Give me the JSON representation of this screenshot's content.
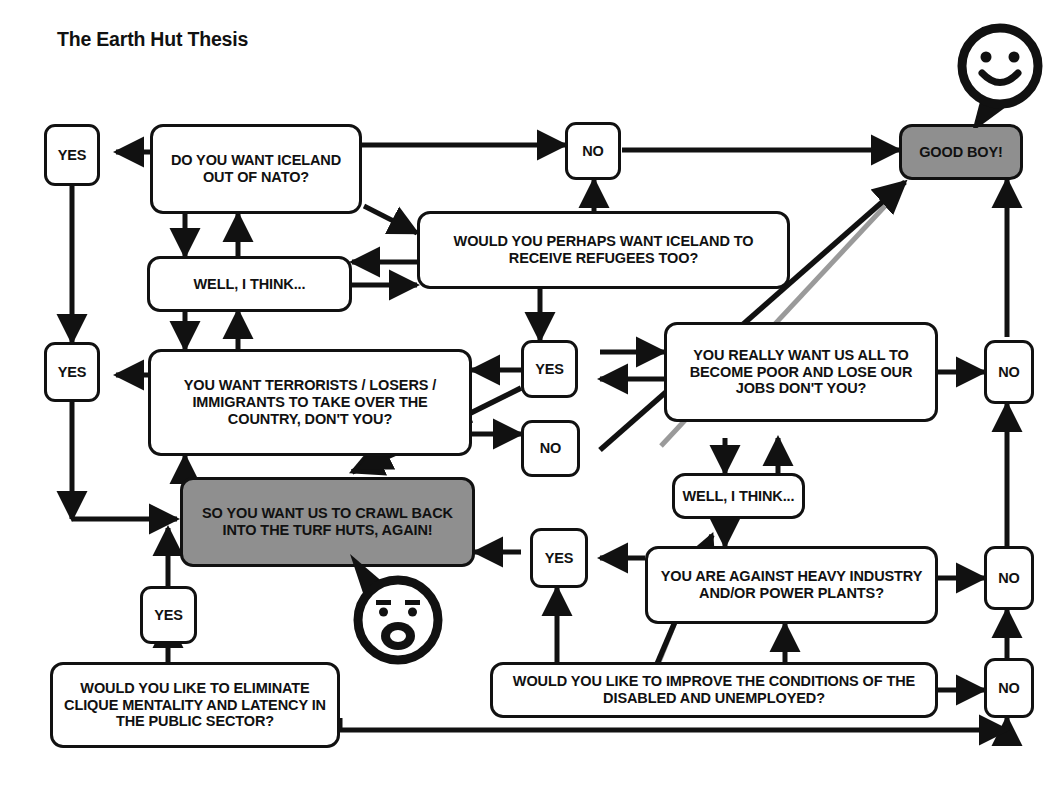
{
  "title": "The Earth Hut Thesis",
  "colors": {
    "ink": "#111111",
    "paper": "#ffffff",
    "shaded_fill": "#8f8f8f",
    "faint_diagonal": "#9a9a9a"
  },
  "diagram": {
    "type": "flowchart",
    "nodes": [
      {
        "id": "yes-top-left",
        "label": "YES",
        "kind": "answer",
        "shaded": false
      },
      {
        "id": "q-nato",
        "label": "DO YOU WANT ICELAND OUT OF NATO?",
        "kind": "question",
        "shaded": false
      },
      {
        "id": "no-top",
        "label": "NO",
        "kind": "answer",
        "shaded": false
      },
      {
        "id": "good-boy",
        "label": "GOOD BOY!",
        "kind": "verdict",
        "shaded": true
      },
      {
        "id": "think-top",
        "label": "WELL, I THINK...",
        "kind": "hedge",
        "shaded": false
      },
      {
        "id": "q-refugees",
        "label": "WOULD YOU PERHAPS WANT ICELAND TO RECEIVE REFUGEES TOO?",
        "kind": "question",
        "shaded": false
      },
      {
        "id": "yes-mid-left",
        "label": "YES",
        "kind": "answer",
        "shaded": false
      },
      {
        "id": "q-terrorists",
        "label": "YOU WANT TERRORISTS / LOSERS / IMMIGRANTS TO TAKE OVER THE COUNTRY, DON'T YOU?",
        "kind": "question",
        "shaded": false
      },
      {
        "id": "yes-center",
        "label": "YES",
        "kind": "answer",
        "shaded": false
      },
      {
        "id": "q-poor",
        "label": "YOU REALLY WANT US ALL TO BECOME POOR AND LOSE OUR JOBS DON'T YOU?",
        "kind": "question",
        "shaded": false
      },
      {
        "id": "no-right-upper",
        "label": "NO",
        "kind": "answer",
        "shaded": false
      },
      {
        "id": "no-center",
        "label": "NO",
        "kind": "answer",
        "shaded": false
      },
      {
        "id": "turf-huts",
        "label": "SO YOU WANT US TO CRAWL BACK INTO THE TURF HUTS, AGAIN!",
        "kind": "verdict",
        "shaded": true
      },
      {
        "id": "think-right",
        "label": "WELL, I THINK...",
        "kind": "hedge",
        "shaded": false
      },
      {
        "id": "yes-lower",
        "label": "YES",
        "kind": "answer",
        "shaded": false
      },
      {
        "id": "q-industry",
        "label": "YOU ARE AGAINST HEAVY INDUSTRY AND/OR POWER PLANTS?",
        "kind": "question",
        "shaded": false
      },
      {
        "id": "no-right-mid",
        "label": "NO",
        "kind": "answer",
        "shaded": false
      },
      {
        "id": "yes-bottom-left",
        "label": "YES",
        "kind": "answer",
        "shaded": false
      },
      {
        "id": "q-disabled",
        "label": "WOULD YOU LIKE TO IMPROVE THE CONDITIONS OF THE DISABLED AND UNEMPLOYED?",
        "kind": "question",
        "shaded": false
      },
      {
        "id": "no-right-lower",
        "label": "NO",
        "kind": "answer",
        "shaded": false
      },
      {
        "id": "q-clique",
        "label": "WOULD YOU LIKE TO ELIMINATE CLIQUE MENTALITY AND LATENCY IN THE PUBLIC SECTOR?",
        "kind": "question",
        "shaded": false
      }
    ],
    "faces": [
      {
        "id": "happy-face",
        "expression": "smiling",
        "attached_to": "good-boy"
      },
      {
        "id": "shocked-face",
        "expression": "shocked",
        "attached_to": "turf-huts"
      }
    ],
    "answer_labels": [
      "YES",
      "NO"
    ],
    "hedge_label": "WELL, I THINK...",
    "verdicts": [
      "GOOD BOY!",
      "SO YOU WANT US TO CRAWL BACK INTO THE TURF HUTS, AGAIN!"
    ]
  }
}
